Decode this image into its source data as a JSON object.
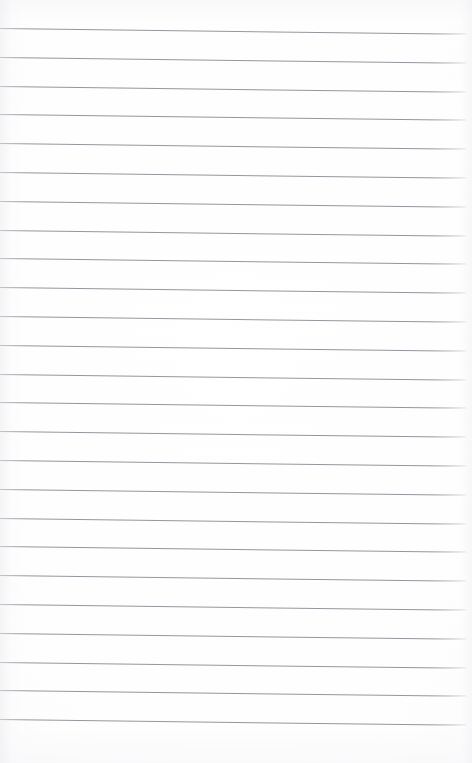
{
  "page": {
    "kind": "lined-paper-page",
    "width": 472,
    "height": 763,
    "content_text": "",
    "paper_color": "#fdfdfd",
    "rule_color": "#8d8d95",
    "rule_thickness_px": 1,
    "rule_spacing_px": 28.8,
    "rule_count": 25,
    "first_rule_y": 28,
    "last_rule_y": 719,
    "rule_left_x": 0,
    "rule_right_x": 466,
    "skew_degrees": 0.72,
    "top_margin_px": 28,
    "bottom_margin_px": 40,
    "right_margin_px": 6,
    "has_margin_rule": false,
    "has_holes": false,
    "has_handwriting": false
  },
  "rules": [
    {
      "index": 1,
      "y": 28,
      "width": 466
    },
    {
      "index": 2,
      "y": 57,
      "width": 466
    },
    {
      "index": 3,
      "y": 86,
      "width": 466
    },
    {
      "index": 4,
      "y": 114,
      "width": 466
    },
    {
      "index": 5,
      "y": 143,
      "width": 466
    },
    {
      "index": 6,
      "y": 172,
      "width": 466
    },
    {
      "index": 7,
      "y": 201,
      "width": 466
    },
    {
      "index": 8,
      "y": 230,
      "width": 466
    },
    {
      "index": 9,
      "y": 258,
      "width": 466
    },
    {
      "index": 10,
      "y": 287,
      "width": 466
    },
    {
      "index": 11,
      "y": 316,
      "width": 466
    },
    {
      "index": 12,
      "y": 345,
      "width": 466
    },
    {
      "index": 13,
      "y": 374,
      "width": 466
    },
    {
      "index": 14,
      "y": 402,
      "width": 466
    },
    {
      "index": 15,
      "y": 431,
      "width": 466
    },
    {
      "index": 16,
      "y": 460,
      "width": 466
    },
    {
      "index": 17,
      "y": 489,
      "width": 466
    },
    {
      "index": 18,
      "y": 518,
      "width": 466
    },
    {
      "index": 19,
      "y": 546,
      "width": 466
    },
    {
      "index": 20,
      "y": 575,
      "width": 466
    },
    {
      "index": 21,
      "y": 604,
      "width": 466
    },
    {
      "index": 22,
      "y": 633,
      "width": 466
    },
    {
      "index": 23,
      "y": 662,
      "width": 466
    },
    {
      "index": 24,
      "y": 690,
      "width": 466
    },
    {
      "index": 25,
      "y": 719,
      "width": 466
    }
  ]
}
